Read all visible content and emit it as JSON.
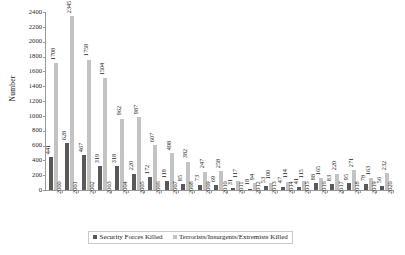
{
  "chart_data": {
    "type": "bar",
    "title": "",
    "xlabel": "",
    "ylabel": "Number",
    "ylim": [
      0,
      2400
    ],
    "ytick_step": 200,
    "yticks": [
      0,
      200,
      400,
      600,
      800,
      1000,
      1200,
      1400,
      1600,
      1800,
      2000,
      2200,
      2400
    ],
    "grid": false,
    "legend_position": "bottom",
    "categories": [
      "2000",
      "2001",
      "2002",
      "2003",
      "2004",
      "2005",
      "2006",
      "2007",
      "2008",
      "2009",
      "2010",
      "2011",
      "2012",
      "2013",
      "2014",
      "2015",
      "2016",
      "2017",
      "2018",
      "2019",
      "2020"
    ],
    "series": [
      {
        "name": "Security Forces Killed",
        "color": "#595959",
        "values": [
          441,
          628,
          467,
          319,
          318,
          220,
          172,
          119,
          85,
          73,
          69,
          31,
          18,
          53,
          47,
          41,
          88,
          83,
          95,
          78,
          56
        ]
      },
      {
        "name": "Terrorists/Insurgents/Extremists Killed",
        "color": "#c3c3c3",
        "values": [
          1708,
          2345,
          1758,
          1504,
          962,
          987,
          607,
          498,
          382,
          247,
          258,
          117,
          94,
          100,
          114,
          115,
          165,
          220,
          271,
          163,
          232
        ]
      }
    ]
  },
  "legend": {
    "items": [
      {
        "label": "Security Forces Killed",
        "color": "#595959"
      },
      {
        "label": "Terrorists/Insurgents/Extremists Killed",
        "color": "#c3c3c3"
      }
    ]
  }
}
